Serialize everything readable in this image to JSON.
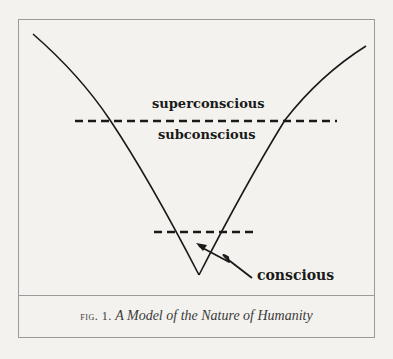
{
  "figure": {
    "labels": {
      "superconscious": "superconscious",
      "subconscious": "subconscious",
      "conscious": "conscious"
    },
    "caption": {
      "prefix": "fig. 1.",
      "title": "A Model of the Nature of Humanity"
    }
  },
  "diagram": {
    "type": "conceptual-model",
    "shape": "V-shaped curve (funnel) with vertex at bottom",
    "threshold_lines": [
      {
        "name": "superconscious/subconscious boundary",
        "style": "dashed",
        "position": "upper"
      },
      {
        "name": "conscious threshold",
        "style": "dashed",
        "position": "lower, near vertex"
      }
    ],
    "annotation": {
      "text": "conscious",
      "pointer": "zigzag arrow pointing into region below lower dashed line"
    },
    "colors": {
      "background": "#f3f2ee",
      "line": "#1a1a1a",
      "frame": "#9a9a9a"
    }
  }
}
